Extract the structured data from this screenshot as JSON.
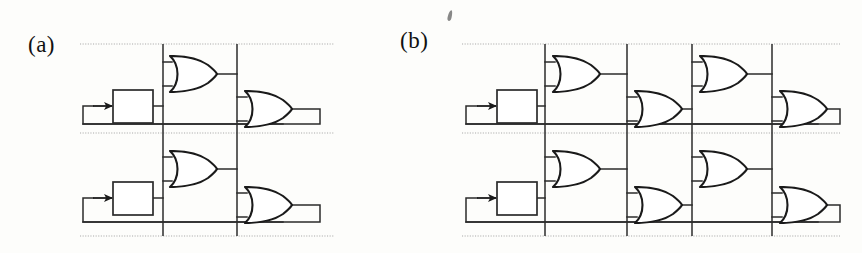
{
  "figure": {
    "width": 862,
    "height": 253,
    "background_color": "#fdfdfb",
    "ink_color": "#1a1a1a",
    "bus_color": "#9a9a9a",
    "artifact": {
      "name": "scan-speck",
      "x": 448,
      "y": 10
    }
  },
  "panels": [
    {
      "id": "a",
      "label": "(a)",
      "label_x": 28,
      "label_y": 32,
      "description": "Two-stage OR-gate feedback network with two clocked latch blocks",
      "frame": {
        "x": 78,
        "y": 42,
        "width": 255,
        "height": 196
      },
      "bus_lines_x": [
        163,
        237
      ],
      "dotted_rails_y": [
        44,
        133,
        236
      ],
      "latches": [
        {
          "name": "latch-block-upper",
          "x": 113,
          "y": 90,
          "width": 40,
          "height": 33,
          "input_arrow_x": 93,
          "input_arrow_y": 106
        },
        {
          "name": "latch-block-lower",
          "x": 113,
          "y": 182,
          "width": 40,
          "height": 33,
          "input_arrow_x": 93,
          "input_arrow_y": 198
        }
      ],
      "or_gates": [
        {
          "name": "or-gate-upper-stage1",
          "x": 168,
          "y": 55,
          "width": 50,
          "height": 38
        },
        {
          "name": "or-gate-upper-stage2",
          "x": 243,
          "y": 90,
          "width": 50,
          "height": 38
        },
        {
          "name": "or-gate-lower-stage1",
          "x": 168,
          "y": 150,
          "width": 50,
          "height": 38
        },
        {
          "name": "or-gate-lower-stage2",
          "x": 243,
          "y": 186,
          "width": 50,
          "height": 38
        }
      ],
      "gate_count": 4,
      "latch_count": 2,
      "stage_count": 2
    },
    {
      "id": "b",
      "label": "(b)",
      "label_x": 400,
      "label_y": 28,
      "description": "Four-stage staggered OR-gate feedback network with two clocked latch blocks",
      "frame": {
        "x": 460,
        "y": 42,
        "width": 375,
        "height": 196
      },
      "bus_lines_x": [
        545,
        627,
        692,
        772
      ],
      "dotted_rails_y": [
        44,
        133,
        236
      ],
      "latches": [
        {
          "name": "latch-block-upper",
          "x": 497,
          "y": 90,
          "width": 40,
          "height": 33,
          "input_arrow_x": 477,
          "input_arrow_y": 106
        },
        {
          "name": "latch-block-lower",
          "x": 497,
          "y": 182,
          "width": 40,
          "height": 33,
          "input_arrow_x": 477,
          "input_arrow_y": 198
        }
      ],
      "or_gates": [
        {
          "name": "or-gate-upper-stage1",
          "x": 551,
          "y": 55,
          "width": 50,
          "height": 38
        },
        {
          "name": "or-gate-upper-stage2",
          "x": 633,
          "y": 90,
          "width": 50,
          "height": 38
        },
        {
          "name": "or-gate-upper-stage3",
          "x": 698,
          "y": 55,
          "width": 50,
          "height": 38
        },
        {
          "name": "or-gate-upper-stage4",
          "x": 778,
          "y": 90,
          "width": 50,
          "height": 38
        },
        {
          "name": "or-gate-lower-stage1",
          "x": 551,
          "y": 150,
          "width": 50,
          "height": 38
        },
        {
          "name": "or-gate-lower-stage2",
          "x": 633,
          "y": 186,
          "width": 50,
          "height": 38
        },
        {
          "name": "or-gate-lower-stage3",
          "x": 698,
          "y": 150,
          "width": 50,
          "height": 38
        },
        {
          "name": "or-gate-lower-stage4",
          "x": 778,
          "y": 186,
          "width": 50,
          "height": 38
        }
      ],
      "gate_count": 8,
      "latch_count": 2,
      "stage_count": 4
    }
  ]
}
